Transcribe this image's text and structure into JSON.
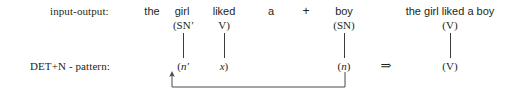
{
  "figure": {
    "background_color": "#ffffff",
    "ink_color": "#231f20",
    "rows": [
      {
        "id": "input-output",
        "label": "input-output:"
      },
      {
        "id": "det-n-pattern",
        "label": "DET+N - pattern:"
      }
    ],
    "surface_tokens": [
      {
        "name": "the",
        "text": "the",
        "x": 152
      },
      {
        "name": "girl",
        "text": "girl",
        "x": 182
      },
      {
        "name": "liked",
        "text": "liked",
        "x": 224
      },
      {
        "name": "a",
        "text": "a",
        "x": 271
      },
      {
        "name": "boy",
        "text": "boy",
        "x": 344
      }
    ],
    "plus_operator": {
      "text": "+",
      "x": 306
    },
    "result_phrase": {
      "text": "the girl liked a boy",
      "x": 450
    },
    "top_categories": [
      {
        "name": "sn-prime",
        "prefix": "(SN",
        "prime": "′",
        "suffix": "",
        "x": 183
      },
      {
        "name": "v-open",
        "prefix": "V",
        "prime": "",
        "suffix": ")",
        "x": 224
      },
      {
        "name": "sn",
        "prefix": "(SN",
        "prime": "",
        "suffix": ")",
        "x": 344
      },
      {
        "name": "v-result",
        "prefix": "(V",
        "prime": "",
        "suffix": ")",
        "x": 450
      }
    ],
    "bottom_categories": [
      {
        "name": "n-prime",
        "open": "(",
        "italic": "n",
        "prime": "′",
        "close": "",
        "x": 183
      },
      {
        "name": "x-variable",
        "open": "",
        "italic": "x",
        "prime": "",
        "close": ")",
        "x": 224
      },
      {
        "name": "n-variable",
        "open": "(",
        "italic": "n",
        "prime": "",
        "close": ")",
        "x": 344
      },
      {
        "name": "v-output",
        "open": "(",
        "italic": "",
        "prime": "",
        "close": "",
        "plain": "V",
        "closeParen": ")",
        "x": 450
      }
    ],
    "implication_operator": {
      "text": "⇒",
      "x": 386
    },
    "vertical_connectors": [
      {
        "name": "connector-sn-prime-to-n-prime",
        "x": 183,
        "y1": 33,
        "y2": 58
      },
      {
        "name": "connector-v-to-x",
        "x": 224,
        "y1": 33,
        "y2": 58
      },
      {
        "name": "connector-sn-to-n",
        "x": 344,
        "y1": 33,
        "y2": 58
      },
      {
        "name": "connector-v-to-v",
        "x": 450,
        "y1": 33,
        "y2": 58
      }
    ],
    "unification_bracket": {
      "name": "unification-arrow",
      "from_x": 345,
      "from_y": 72,
      "down_y": 87,
      "to_x": 172,
      "arrow_tip_y": 72,
      "description": "arrow from (n) back to (n′)"
    }
  }
}
